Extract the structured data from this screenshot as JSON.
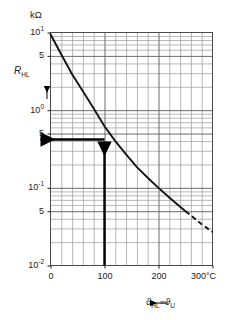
{
  "chart_data": {
    "type": "line",
    "title": "",
    "subtitle": "",
    "xlabel": "ϑHL = ϑU",
    "ylabel": "RHL",
    "yunit": "kΩ",
    "xunit": "°C",
    "xlim": [
      0,
      300
    ],
    "ylim": [
      0.01,
      10
    ],
    "yscale": "log",
    "xscale": "linear",
    "grid": "major and minor, both axes",
    "legend": "none",
    "x_major_ticks": [
      0,
      100,
      200,
      300
    ],
    "x_major_tick_labels": [
      "0",
      "100",
      "200",
      "300°C"
    ],
    "x_minor_step": 20,
    "y_major_ticks": [
      10,
      5,
      1,
      0.5,
      0.1,
      0.05,
      0.01
    ],
    "y_major_tick_labels": [
      "10",
      "5",
      "10",
      "5",
      "10",
      "5",
      "10"
    ],
    "y_decade_labels": [
      "10¹",
      "5",
      "10⁰",
      "5",
      "10⁻¹",
      "5",
      "10⁻²"
    ],
    "series": [
      {
        "name": "R_HL vs temperature",
        "style": "solid then dashed after 250°C",
        "x": [
          0,
          20,
          40,
          60,
          80,
          100,
          120,
          140,
          160,
          180,
          200,
          220,
          240,
          250,
          260,
          280,
          300
        ],
        "y": [
          9.5,
          5.2,
          2.9,
          1.75,
          1.05,
          0.62,
          0.4,
          0.27,
          0.185,
          0.135,
          0.1,
          0.075,
          0.057,
          0.05,
          0.044,
          0.034,
          0.027
        ]
      }
    ],
    "annotations": [
      {
        "name": "operating-point",
        "x": 100,
        "y": 0.42,
        "vertical_arrow_from_x_axis": true,
        "horizontal_arrow_to_y_axis": true
      }
    ]
  },
  "axes": {
    "y_unit_label": "kΩ",
    "y_title_main": "R",
    "y_title_sub": "HL",
    "x_title_symbol1": "ϑ",
    "x_title_sub1": "HL",
    "x_title_eq": "=",
    "x_title_symbol2": "ϑ",
    "x_title_sub2": "U",
    "y_ticks": [
      {
        "label_main": "10",
        "label_sup": "1",
        "value": 10
      },
      {
        "label_main": "5",
        "label_sup": "",
        "value": 5
      },
      {
        "label_main": "10",
        "label_sup": "0",
        "value": 1
      },
      {
        "label_main": "5",
        "label_sup": "",
        "value": 0.5
      },
      {
        "label_main": "10",
        "label_sup": "-1",
        "value": 0.1
      },
      {
        "label_main": "5",
        "label_sup": "",
        "value": 0.05
      },
      {
        "label_main": "10",
        "label_sup": "-2",
        "value": 0.01
      }
    ],
    "x_ticks": [
      {
        "label": "0",
        "value": 0
      },
      {
        "label": "100",
        "value": 100
      },
      {
        "label": "200",
        "value": 200
      },
      {
        "label": "300°C",
        "value": 300
      }
    ]
  },
  "colors": {
    "ink": "#1a1a1a",
    "grid_major": "#6b6b6b",
    "grid_minor": "#9a9a9a",
    "curve": "#141414",
    "annotation": "#000000",
    "background": "#ffffff"
  }
}
